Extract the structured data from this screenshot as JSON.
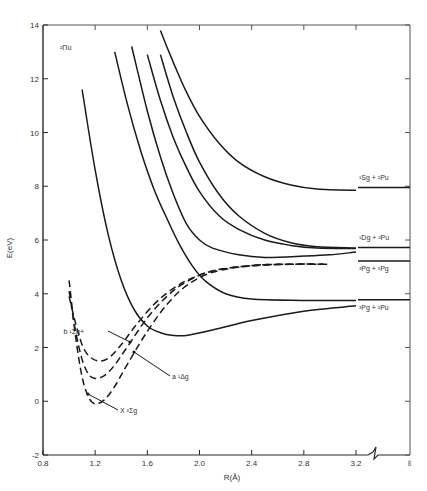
{
  "chart_data": {
    "type": "line",
    "title": "",
    "xlabel": "R(Å)",
    "ylabel": "E(eV)",
    "xlim": [
      0.8,
      3.2
    ],
    "ylim": [
      -2,
      14
    ],
    "x_ticks": [
      "0.8",
      "1.2",
      "1.6",
      "2.0",
      "2.4",
      "2.8",
      "3.2",
      "∞"
    ],
    "x_tick_values": [
      0.8,
      1.2,
      1.6,
      2.0,
      2.4,
      2.8,
      3.2
    ],
    "y_ticks": [
      "-2",
      "0",
      "2",
      "4",
      "6",
      "8",
      "10",
      "12",
      "14"
    ],
    "y_tick_values": [
      -2,
      0,
      2,
      4,
      6,
      8,
      10,
      12,
      14
    ],
    "axis_break": "between 3.2 and ∞",
    "grid": false,
    "symmetry_label": "²Πu",
    "series": [
      {
        "name": "X ³Σg",
        "style": "dashed",
        "label": "X ³Σg",
        "points": [
          [
            1.0,
            4.5
          ],
          [
            1.05,
            2.4
          ],
          [
            1.1,
            0.9
          ],
          [
            1.15,
            0.15
          ],
          [
            1.2,
            -0.1
          ],
          [
            1.27,
            0.05
          ],
          [
            1.35,
            0.55
          ],
          [
            1.45,
            1.4
          ],
          [
            1.6,
            2.6
          ],
          [
            1.75,
            3.6
          ],
          [
            1.9,
            4.3
          ],
          [
            2.1,
            4.8
          ],
          [
            2.4,
            5.05
          ],
          [
            2.7,
            5.1
          ],
          [
            3.0,
            5.1
          ]
        ]
      },
      {
        "name": "a ¹Δg",
        "style": "dashed",
        "label": "a ¹Δg",
        "points": [
          [
            1.0,
            4.1
          ],
          [
            1.05,
            2.6
          ],
          [
            1.1,
            1.55
          ],
          [
            1.15,
            1.0
          ],
          [
            1.2,
            0.85
          ],
          [
            1.27,
            0.95
          ],
          [
            1.35,
            1.35
          ],
          [
            1.45,
            2.05
          ],
          [
            1.6,
            3.1
          ],
          [
            1.75,
            3.9
          ],
          [
            1.9,
            4.45
          ],
          [
            2.1,
            4.85
          ],
          [
            2.4,
            5.05
          ],
          [
            2.7,
            5.1
          ],
          [
            2.95,
            5.1
          ]
        ]
      },
      {
        "name": "b ¹Σg+",
        "style": "dashed",
        "label": "b ¹Σg+",
        "points": [
          [
            1.0,
            3.9
          ],
          [
            1.05,
            2.9
          ],
          [
            1.1,
            2.1
          ],
          [
            1.15,
            1.7
          ],
          [
            1.22,
            1.5
          ],
          [
            1.3,
            1.6
          ],
          [
            1.4,
            2.1
          ],
          [
            1.5,
            2.75
          ],
          [
            1.65,
            3.6
          ],
          [
            1.8,
            4.2
          ],
          [
            1.95,
            4.6
          ],
          [
            2.15,
            4.9
          ],
          [
            2.45,
            5.05
          ],
          [
            2.75,
            5.1
          ],
          [
            2.95,
            5.1
          ]
        ]
      },
      {
        "name": "²Πu state 1 (→ ³Pg+²Pu)",
        "style": "solid",
        "points": [
          [
            1.1,
            11.6
          ],
          [
            1.2,
            8.6
          ],
          [
            1.3,
            6.2
          ],
          [
            1.4,
            4.5
          ],
          [
            1.5,
            3.4
          ],
          [
            1.6,
            2.8
          ],
          [
            1.7,
            2.55
          ],
          [
            1.8,
            2.45
          ],
          [
            1.9,
            2.45
          ],
          [
            2.1,
            2.65
          ],
          [
            2.4,
            3.0
          ],
          [
            2.8,
            3.35
          ],
          [
            3.2,
            3.55
          ]
        ]
      },
      {
        "name": "²Πu state 2 (→ ³Pg+²Pu)",
        "style": "solid",
        "points": [
          [
            1.35,
            13.0
          ],
          [
            1.45,
            11.0
          ],
          [
            1.55,
            9.3
          ],
          [
            1.65,
            7.9
          ],
          [
            1.75,
            6.8
          ],
          [
            1.85,
            5.8
          ],
          [
            1.95,
            5.0
          ],
          [
            2.05,
            4.45
          ],
          [
            2.2,
            4.0
          ],
          [
            2.4,
            3.8
          ],
          [
            2.8,
            3.75
          ],
          [
            3.2,
            3.75
          ]
        ]
      },
      {
        "name": "²Πu state 3 (→ ³Pg+³Pg)",
        "style": "solid",
        "points": [
          [
            1.48,
            13.2
          ],
          [
            1.6,
            10.8
          ],
          [
            1.7,
            9.1
          ],
          [
            1.8,
            7.7
          ],
          [
            1.9,
            6.6
          ],
          [
            2.0,
            6.0
          ],
          [
            2.1,
            5.7
          ],
          [
            2.3,
            5.45
          ],
          [
            2.5,
            5.35
          ],
          [
            2.8,
            5.4
          ],
          [
            3.0,
            5.45
          ],
          [
            3.2,
            5.55
          ]
        ]
      },
      {
        "name": "²Πu state 4 (→ ¹Dg+²Pu)",
        "style": "solid",
        "points": [
          [
            1.6,
            12.9
          ],
          [
            1.7,
            11.2
          ],
          [
            1.8,
            9.8
          ],
          [
            1.9,
            8.7
          ],
          [
            2.0,
            7.8
          ],
          [
            2.15,
            6.9
          ],
          [
            2.3,
            6.4
          ],
          [
            2.5,
            6.0
          ],
          [
            2.7,
            5.8
          ],
          [
            2.9,
            5.7
          ],
          [
            3.2,
            5.68
          ]
        ]
      },
      {
        "name": "²Πu state 5 (→ ¹Dg+²Pu)",
        "style": "solid",
        "points": [
          [
            1.7,
            12.9
          ],
          [
            1.8,
            11.3
          ],
          [
            1.9,
            10.0
          ],
          [
            2.0,
            8.9
          ],
          [
            2.15,
            7.7
          ],
          [
            2.3,
            6.9
          ],
          [
            2.5,
            6.25
          ],
          [
            2.7,
            5.9
          ],
          [
            2.9,
            5.75
          ],
          [
            3.2,
            5.7
          ]
        ]
      },
      {
        "name": "²Πu state 6 (→ ¹Sg+²Pu)",
        "style": "solid",
        "points": [
          [
            1.7,
            13.8
          ],
          [
            1.8,
            12.6
          ],
          [
            1.9,
            11.5
          ],
          [
            2.0,
            10.6
          ],
          [
            2.15,
            9.6
          ],
          [
            2.3,
            8.9
          ],
          [
            2.5,
            8.35
          ],
          [
            2.7,
            8.05
          ],
          [
            2.9,
            7.9
          ],
          [
            3.2,
            7.85
          ]
        ]
      }
    ],
    "asymptotes": [
      {
        "label": "¹Sg + ²Pu",
        "E": 7.95
      },
      {
        "label": "¹Dg + ²Pu",
        "E": 5.72
      },
      {
        "label": "³Pg + ³Pg",
        "E": 5.22
      },
      {
        "label": "³Pg + ²Pu",
        "E": 3.78
      }
    ]
  }
}
